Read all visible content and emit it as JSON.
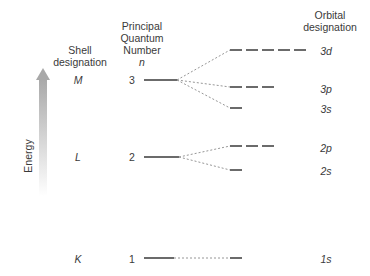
{
  "headers": {
    "shell": [
      "Shell",
      "designation"
    ],
    "quantum": [
      "Principal",
      "Quantum",
      "Number",
      "n"
    ],
    "orbital": [
      "Orbital",
      "designation"
    ]
  },
  "axis": {
    "label": "Energy",
    "arrow_color": "#b8b8b8"
  },
  "shells": [
    {
      "designation": "M",
      "n": "3"
    },
    {
      "designation": "L",
      "n": "2"
    },
    {
      "designation": "K",
      "n": "1"
    }
  ],
  "orbitals": [
    {
      "label": "3d",
      "count": 5
    },
    {
      "label": "3p",
      "count": 3
    },
    {
      "label": "3s",
      "count": 1
    },
    {
      "label": "2p",
      "count": 3
    },
    {
      "label": "2s",
      "count": 1
    },
    {
      "label": "1s",
      "count": 1
    }
  ],
  "colors": {
    "line": "#3a3a3a",
    "dotted": "#8a8a8a",
    "text": "#3a3a3a"
  }
}
